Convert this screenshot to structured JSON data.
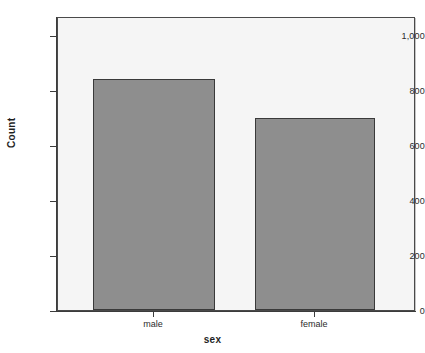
{
  "chart_data": {
    "type": "bar",
    "title": "",
    "subtitle": "",
    "categories": [
      "male",
      "female"
    ],
    "values": [
      825,
      687
    ],
    "series": [
      {
        "name": "Count",
        "values": [
          825,
          687
        ]
      }
    ],
    "xlabel": "sex",
    "ylabel": "Count",
    "ylim": [
      0,
      1050
    ],
    "yticks": [
      0,
      200,
      400,
      600,
      800,
      1000
    ],
    "ytick_labels": [
      "0",
      "200",
      "400",
      "600",
      "800",
      "1,000"
    ],
    "xtick_labels": [
      "male",
      "female"
    ],
    "grid": false,
    "legend": false,
    "legend_position": "none",
    "bar_color": "#8e8e8e",
    "bar_edge_color": "#3a3a3a",
    "panel_background": "#f5f5f5",
    "figure_background": "#ffffff",
    "axis_color": "#3c3c3c",
    "text_color": "#2b2b2b"
  }
}
